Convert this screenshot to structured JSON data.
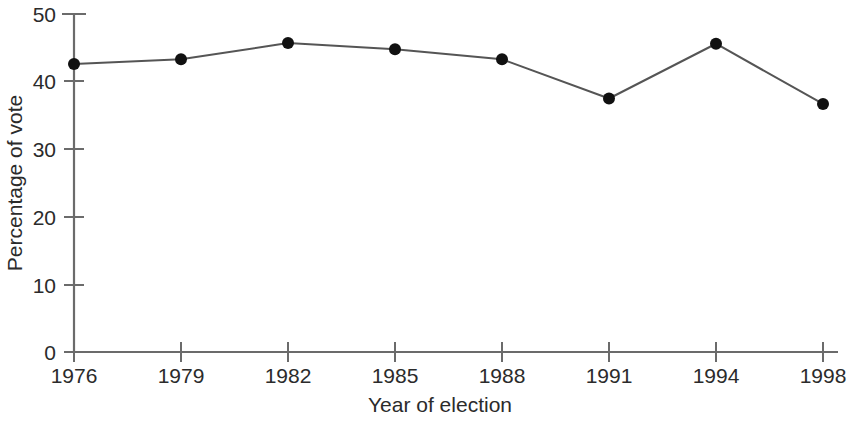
{
  "chart_data": {
    "type": "line",
    "title": "",
    "subtitle": "",
    "xlabel": "Year of election",
    "ylabel": "Percentage of vote",
    "categories": [
      "1976",
      "1979",
      "1982",
      "1985",
      "1988",
      "1991",
      "1994",
      "1998"
    ],
    "values": [
      42.6,
      43.3,
      45.7,
      44.8,
      43.3,
      37.5,
      45.6,
      36.7
    ],
    "series": [
      {
        "name": "Percentage of vote",
        "values": [
          42.6,
          43.3,
          45.7,
          44.8,
          43.3,
          37.5,
          45.6,
          36.7
        ]
      }
    ],
    "y_ticks": [
      0,
      10,
      20,
      30,
      40,
      50
    ],
    "y_tick_labels": [
      "0",
      "10",
      "20",
      "30",
      "40",
      "50"
    ],
    "x_tick_labels": [
      "1976",
      "1979",
      "1982",
      "1985",
      "1988",
      "1991",
      "1994",
      "1998"
    ],
    "ylim": [
      0,
      50
    ],
    "grid": false,
    "legend": false,
    "legend_position": "none",
    "marker": "filled-circle",
    "line_color": "#555555",
    "marker_color": "#111111",
    "axis_color": "#6b6b6b",
    "background_color": "#ffffff",
    "annotations": []
  },
  "figure": {
    "alt": "Line chart of percentage of vote by year of election from 1976 to 1998"
  }
}
